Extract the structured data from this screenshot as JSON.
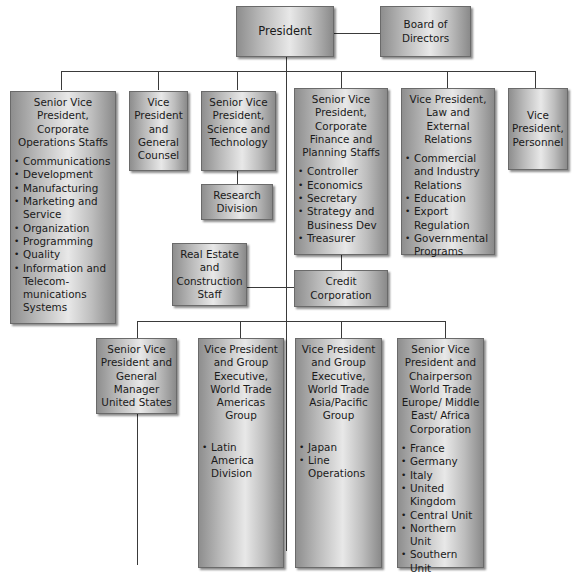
{
  "chart": {
    "president": "President",
    "board": "Board of Directors",
    "top_row": [
      {
        "title": "Senior Vice President, Corporate Operations Staffs",
        "items": [
          "Communications",
          "Development",
          "Manufacturing",
          "Marketing and Service",
          "Organization",
          "Programming",
          "Quality",
          "Information and Telecom-munications Systems"
        ]
      },
      {
        "title": "Vice President and General Counsel",
        "items": []
      },
      {
        "title": "Senior Vice President, Science and Technology",
        "items": []
      },
      {
        "title": "Senior Vice President, Corporate Finance and Planning Staffs",
        "items": [
          "Controller",
          "Economics",
          "Secretary",
          "Strategy and Business Dev",
          "Treasurer"
        ]
      },
      {
        "title": "Vice President, Law and External Relations",
        "items": [
          "Commercial and Industry Relations",
          "Education",
          "Export Regulation",
          "Governmental Programs"
        ]
      },
      {
        "title": "Vice President, Personnel",
        "items": []
      }
    ],
    "research_division": "Research Division",
    "real_estate": "Real Estate and Construction Staff",
    "credit_corporation": "Credit Corporation",
    "bottom_row": [
      {
        "title": "Senior Vice President and General Manager United States",
        "items": []
      },
      {
        "title": "Vice President and Group Executive, World Trade Americas Group",
        "items": [
          "Latin America Division"
        ]
      },
      {
        "title": "Vice President and Group Executive, World Trade Asia/Pacific Group",
        "items": [
          "Japan",
          "Line Operations"
        ]
      },
      {
        "title": "Senior Vice President and Chairperson World Trade Europe/ Middle East/ Africa Corporation",
        "items": [
          "France",
          "Germany",
          "Italy",
          "United Kingdom",
          "Central Unit",
          "Northern Unit",
          "Southern Unit"
        ]
      }
    ]
  }
}
